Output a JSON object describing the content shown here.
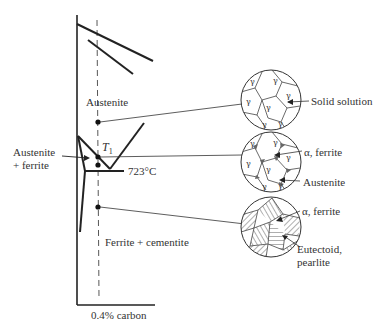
{
  "diagram": {
    "composition_label": "0.4% carbon",
    "regions": {
      "austenite": "Austenite",
      "austenite_ferrite_line1": "Austenite",
      "austenite_ferrite_line2": "+ ferrite",
      "ferrite_cementite": "Ferrite + cementite"
    },
    "temperature_marker": {
      "symbol": "T",
      "subscript": "1"
    },
    "eutectoid_temperature": "723°C",
    "microstructures": [
      {
        "id": "solid-solution",
        "callouts": [
          "Solid solution"
        ],
        "grain_symbol": "γ"
      },
      {
        "id": "austenite-ferrite",
        "callouts": [
          "α, ferrite",
          "Austenite"
        ],
        "grain_symbol": "γ"
      },
      {
        "id": "pearlite",
        "callouts": [
          "α, ferrite",
          "Eutectoid,",
          "pearlite"
        ]
      }
    ]
  }
}
